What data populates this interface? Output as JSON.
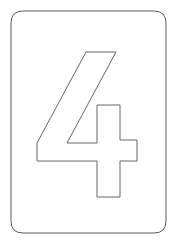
{
  "page": {
    "background_color": "#ffffff",
    "width": 175,
    "height": 244
  },
  "card": {
    "name": "tracing-card",
    "shape": "rounded-rectangle",
    "fill_color": "#ffffff",
    "stroke_color": "#5a5a5a",
    "stroke_width": 1,
    "corner_radius": 12,
    "x": 11,
    "y": 11,
    "width": 155,
    "height": 222,
    "path": "M 23 11 L 154 11 Q 166 11 166 23 L 166 221 Q 166 233 154 233 L 23 233 Q 11 233 11 221 L 11 23 Q 11 11 23 11 Z"
  },
  "glyph": {
    "name": "numeral-four",
    "character": "4",
    "label": "4",
    "style": "hollow-outline",
    "fill_color": "#ffffff",
    "stroke_color": "#666666",
    "stroke_width": 1,
    "bounds": {
      "x": 37,
      "y": 52,
      "width": 100,
      "height": 145
    },
    "path": "M 86 52 L 116 52 L 67 143 L 97 143 L 97 105 L 120 105 L 120 140 L 137 140 L 137 161 L 120 161 L 120 197 L 97 197 L 97 161 L 37 161 L 37 143 Z"
  }
}
